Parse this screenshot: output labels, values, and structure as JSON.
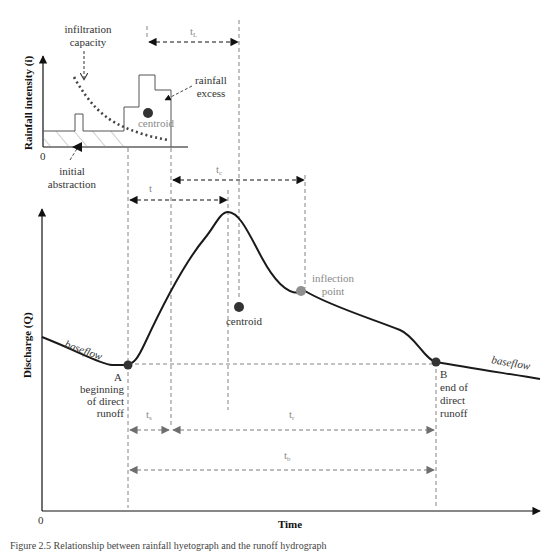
{
  "figure": {
    "type": "hydrograph-diagram",
    "rainfall_panel": {
      "y_axis_label": "Rainfall intensity (i)",
      "origin_label": "0",
      "labels": {
        "infiltration_capacity": [
          "infiltration",
          "capacity"
        ],
        "rainfall_excess": [
          "rainfall",
          "excess"
        ],
        "centroid": "centroid",
        "initial_abstraction": [
          "initial",
          "abstraction"
        ]
      }
    },
    "hydrograph_panel": {
      "y_axis_label": "Discharge (Q)",
      "x_axis_label": "Time",
      "origin_label": "0",
      "labels": {
        "baseflow_left": "baseflow",
        "baseflow_right": "baseflow",
        "point_a": "A",
        "point_a_desc": [
          "beginning",
          "of direct",
          "runoff"
        ],
        "point_b": "B",
        "point_b_desc": [
          "end of",
          "direct",
          "runoff"
        ],
        "centroid": "centroid",
        "inflection_point": [
          "inflection",
          "point"
        ]
      }
    },
    "time_intervals": {
      "tL": "t",
      "tL_sub": "L",
      "tc": "t",
      "tc_sub": "c",
      "t": "t",
      "ts": "t",
      "ts_sub": "s",
      "tr": "t",
      "tr_sub": "r",
      "tb": "t",
      "tb_sub": "b"
    },
    "colors": {
      "curve": "#1a1a1a",
      "centroid_marker": "#333333",
      "inflection_marker": "#8f8f8f",
      "grey_text": "#8a8a8a",
      "dashed_guides": "#666666"
    }
  },
  "caption": "Figure 2.5  Relationship between rainfall hyetograph and the runoff hydrograph"
}
